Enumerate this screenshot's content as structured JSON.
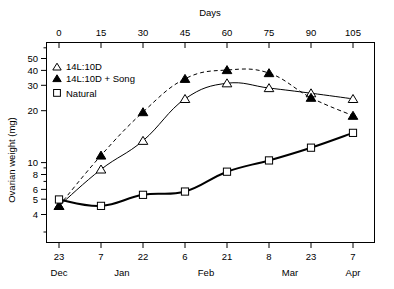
{
  "chart_data": {
    "type": "line",
    "title": "",
    "xlabel_top": "Days",
    "ylabel": "Ovarian weight (mg)",
    "yscale": "log",
    "ylim": [
      3.6,
      60
    ],
    "ytick_labels": [
      "50",
      "40",
      "30",
      "20",
      "10",
      "8",
      "6",
      "5",
      "4"
    ],
    "ytick_values": [
      50,
      40,
      30,
      20,
      10,
      8,
      6,
      5,
      4
    ],
    "yminor_values": [
      60,
      9,
      7
    ],
    "xlim_days": [
      -8,
      113
    ],
    "x_days": [
      0,
      15,
      30,
      45,
      60,
      75,
      90,
      105
    ],
    "xtick_labels_top": [
      "0",
      "15",
      "30",
      "45",
      "60",
      "75",
      "90",
      "105"
    ],
    "xtick_labels_bottom": [
      "23",
      "7",
      "22",
      "6",
      "21",
      "8",
      "23",
      "7"
    ],
    "xtick_months": [
      {
        "label": "Dec",
        "day": 0
      },
      {
        "label": "Jan",
        "day": 22
      },
      {
        "label": "Feb",
        "day": 52
      },
      {
        "label": "Mar",
        "day": 82
      },
      {
        "label": "Apr",
        "day": 105
      }
    ],
    "grid": false,
    "legend_position": "top-left",
    "series": [
      {
        "name": "14L:10D",
        "marker": "open-triangle",
        "line": "solid",
        "x": [
          0,
          15,
          30,
          45,
          60,
          75,
          90,
          105
        ],
        "values": [
          4.6,
          8.3,
          13.2,
          26.0,
          33.5,
          31.0,
          28.5,
          26.0
        ]
      },
      {
        "name": "14L:10D + Song",
        "marker": "filled-triangle",
        "line": "dashed",
        "x": [
          0,
          15,
          30,
          45,
          60,
          75,
          90,
          105
        ],
        "values": [
          4.6,
          10.4,
          21.0,
          36.0,
          41.5,
          39.5,
          26.5,
          19.8
        ]
      },
      {
        "name": "Natural",
        "marker": "open-square",
        "line": "solid-thick",
        "x": [
          0,
          15,
          30,
          45,
          60,
          75,
          90,
          105
        ],
        "values": [
          5.1,
          4.6,
          5.5,
          5.8,
          8.0,
          9.6,
          11.8,
          15.0
        ]
      }
    ]
  },
  "legend": {
    "items": [
      {
        "label": "14L:10D",
        "marker": "open-triangle"
      },
      {
        "label": "14L:10D + Song",
        "marker": "filled-triangle"
      },
      {
        "label": "Natural",
        "marker": "open-square"
      }
    ]
  },
  "axes": {
    "top_title": "Days",
    "y_title": "Ovarian weight (mg)"
  }
}
